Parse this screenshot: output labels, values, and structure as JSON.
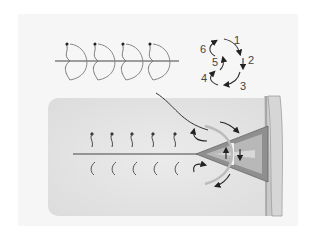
{
  "figure": {
    "type": "diagram",
    "panels": [
      {
        "id": "top-left",
        "description": "Row of four crescent wave-beat strokes along a horizontal axis"
      },
      {
        "id": "top-right",
        "description": "Numbered cyclic stroke sequence"
      },
      {
        "id": "bottom",
        "description": "Row of hook strokes along axis approaching a cone structure in a wall, with flow arrows"
      }
    ],
    "stroke_labels": [
      "1",
      "2",
      "3",
      "4",
      "5",
      "6"
    ],
    "crescent_count": 4,
    "upper_hook_count": 5,
    "lower_hook_count": 5,
    "colors": {
      "background": "#ffffff",
      "frame": "#f6f6f6",
      "panel": "#e9e9e9",
      "line": "#555555",
      "cone_fill": "#8f8f8f",
      "cone_inner": "#b8b8b8",
      "wall": "#c9c9c9"
    }
  }
}
